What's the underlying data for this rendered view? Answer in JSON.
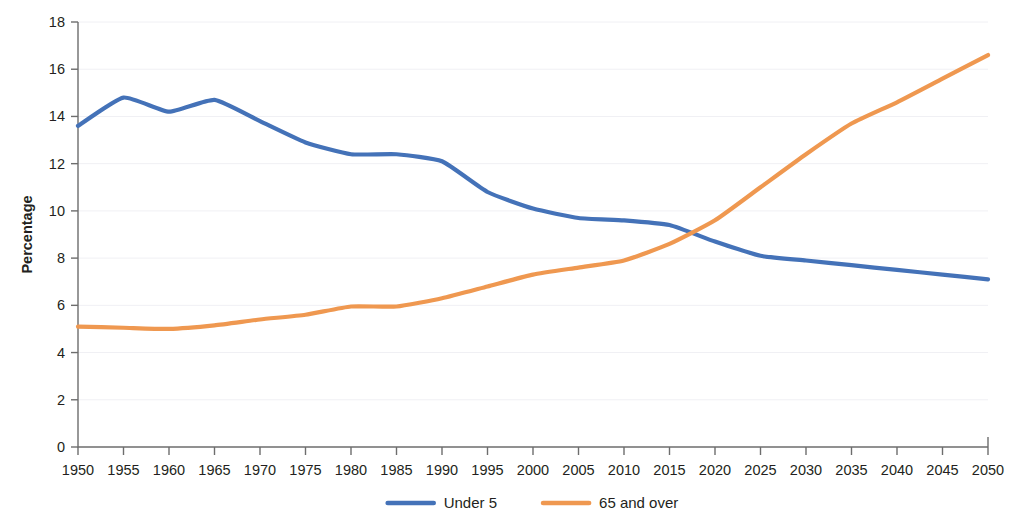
{
  "figure": {
    "clipped_header_text": "",
    "background_color": "#ffffff"
  },
  "chart_data": {
    "type": "line",
    "title": "",
    "subtitle": "",
    "xlabel": "",
    "ylabel": "Percentage",
    "xlim": [
      1950,
      2050
    ],
    "ylim": [
      0,
      18
    ],
    "grid": true,
    "legend_position": "bottom-center",
    "x_tick_labels": [
      "1950",
      "1955",
      "1960",
      "1965",
      "1970",
      "1975",
      "1980",
      "1985",
      "1990",
      "1995",
      "2000",
      "2005",
      "2010",
      "2015",
      "2020",
      "2025",
      "2030",
      "2035",
      "2040",
      "2045",
      "2050"
    ],
    "y_tick_labels": [
      "0",
      "2",
      "4",
      "6",
      "8",
      "10",
      "12",
      "14",
      "16",
      "18"
    ],
    "x": [
      1950,
      1955,
      1960,
      1965,
      1970,
      1975,
      1980,
      1985,
      1990,
      1995,
      2000,
      2005,
      2010,
      2015,
      2020,
      2025,
      2030,
      2035,
      2040,
      2045,
      2050
    ],
    "series": [
      {
        "name": "Under 5",
        "color": "#4472b8",
        "values": [
          13.6,
          14.8,
          14.2,
          14.7,
          13.8,
          12.9,
          12.4,
          12.4,
          12.1,
          10.8,
          10.1,
          9.7,
          9.6,
          9.4,
          8.7,
          8.1,
          7.9,
          7.7,
          7.5,
          7.3,
          7.1
        ]
      },
      {
        "name": "65 and over",
        "color": "#ef9850",
        "values": [
          5.1,
          5.05,
          5.0,
          5.15,
          5.4,
          5.6,
          5.95,
          5.95,
          6.3,
          6.8,
          7.3,
          7.6,
          7.9,
          8.6,
          9.6,
          11.0,
          12.4,
          13.7,
          14.6,
          15.6,
          16.6
        ]
      }
    ],
    "legend": [
      {
        "label": "Under 5",
        "color": "#4472b8"
      },
      {
        "label": "65 and over",
        "color": "#ef9850"
      }
    ]
  },
  "layout": {
    "plot_left": 78,
    "plot_right": 988,
    "plot_top": 22,
    "plot_bottom": 447
  }
}
